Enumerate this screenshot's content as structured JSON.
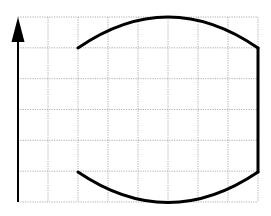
{
  "diagram": {
    "grid": {
      "cols": 8,
      "rows": 6,
      "x0": 18,
      "y0": 17,
      "cell_w": 30,
      "cell_h": 30.83,
      "color": "#9a9a9a"
    },
    "axis": {
      "direction": "up",
      "x": 18,
      "y_bottom": 202,
      "y_tip": 17,
      "color": "#000000"
    },
    "shape": {
      "color": "#000000",
      "top_arc": {
        "start": [
          78,
          48
        ],
        "control": [
          168,
          -14
        ],
        "end": [
          258,
          48
        ]
      },
      "right_edge": {
        "start": [
          258,
          48
        ],
        "end": [
          258,
          172
        ]
      },
      "bottom_arc": {
        "start": [
          78,
          172
        ],
        "control": [
          168,
          233
        ],
        "end": [
          258,
          172
        ]
      }
    }
  }
}
